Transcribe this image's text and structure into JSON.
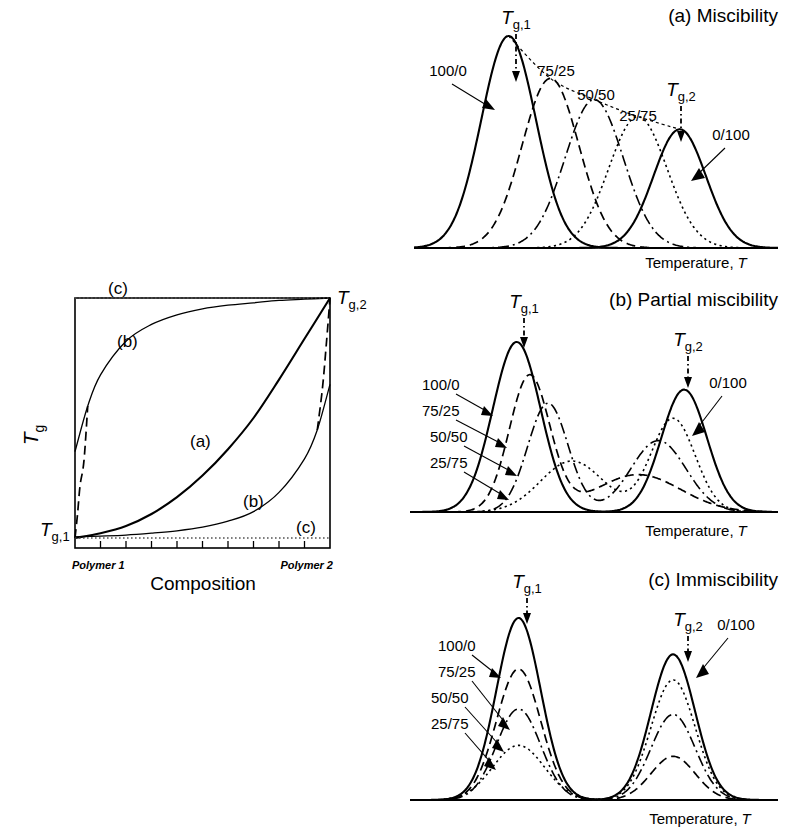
{
  "figure": {
    "axis_label_temperature": "Temperature,",
    "axis_label_temperature_symbol": "T",
    "tg1_symbol": "T",
    "tg1_sub": "g,1",
    "tg2_symbol": "T",
    "tg2_sub": "g,2"
  },
  "left_plot": {
    "ylabel_symbol": "T",
    "ylabel_sub": "g",
    "xlabel": "Composition",
    "x_start_label": "Polymer 1",
    "x_end_label": "Polymer 2",
    "tg1_symbol": "T",
    "tg1_sub": "g,1",
    "tg2_symbol": "T",
    "tg2_sub": "g,2",
    "curve_labels": {
      "a": "(a)",
      "b_upper": "(b)",
      "b_lower": "(b)",
      "c_upper": "(c)",
      "c_lower": "(c)"
    }
  },
  "panels": [
    {
      "id": "a",
      "title": "(a) Miscibility"
    },
    {
      "id": "b",
      "title": "(b) Partial miscibility"
    },
    {
      "id": "c",
      "title": "(c) Immiscibility"
    }
  ],
  "compositions": [
    "100/0",
    "75/25",
    "50/50",
    "25/75",
    "0/100"
  ],
  "chart_data": [
    {
      "type": "line",
      "id": "left-plot",
      "title": "",
      "xlabel": "Composition",
      "ylabel": "Tg",
      "xlim": [
        0,
        1
      ],
      "ylim": [
        0,
        1
      ],
      "xtick_labels": [
        "Polymer 1",
        "Polymer 2"
      ],
      "ytick_labels": [
        "Tg,1",
        "Tg,2"
      ],
      "grid": false,
      "legend": "inline-annotations",
      "series": [
        {
          "name": "(a) miscible - single Tg, convex",
          "style": "solid",
          "x": [
            0,
            0.1,
            0.2,
            0.3,
            0.4,
            0.5,
            0.6,
            0.7,
            0.8,
            0.9,
            1.0
          ],
          "y": [
            0.0,
            0.02,
            0.05,
            0.1,
            0.17,
            0.26,
            0.37,
            0.5,
            0.66,
            0.83,
            1.0
          ]
        },
        {
          "name": "(b) partial - upper branch",
          "style": "solid-thin",
          "x": [
            0,
            0.05,
            0.1,
            0.2,
            0.3,
            0.4,
            0.5,
            0.6,
            0.7,
            0.8,
            0.9,
            1.0
          ],
          "y": [
            0.36,
            0.55,
            0.68,
            0.82,
            0.89,
            0.93,
            0.955,
            0.97,
            0.98,
            0.99,
            0.995,
            1.0
          ]
        },
        {
          "name": "(b) partial - lower branch",
          "style": "solid-thin",
          "x": [
            0,
            0.1,
            0.2,
            0.3,
            0.4,
            0.5,
            0.6,
            0.7,
            0.8,
            0.9,
            0.95,
            1.0
          ],
          "y": [
            0.005,
            0.008,
            0.012,
            0.02,
            0.03,
            0.045,
            0.07,
            0.11,
            0.19,
            0.33,
            0.45,
            0.64
          ]
        },
        {
          "name": "(b) dashed continuation near Polymer 1",
          "style": "dashed",
          "x": [
            0.0,
            0.01,
            0.02,
            0.035,
            0.05
          ],
          "y": [
            0.0,
            0.1,
            0.22,
            0.32,
            0.55
          ]
        },
        {
          "name": "(b) dashed continuation near Polymer 2",
          "style": "dashed",
          "x": [
            0.95,
            0.97,
            0.985,
            1.0
          ],
          "y": [
            0.45,
            0.62,
            0.8,
            1.0
          ]
        },
        {
          "name": "(c) immiscible - Tg,2 constant line",
          "style": "dotted",
          "x": [
            0,
            1
          ],
          "y": [
            1.0,
            1.0
          ]
        },
        {
          "name": "(c) immiscible - Tg,1 constant line",
          "style": "dotted",
          "x": [
            0,
            1
          ],
          "y": [
            0.0,
            0.0
          ]
        }
      ]
    },
    {
      "type": "line",
      "id": "panel-a",
      "title": "(a) Miscibility",
      "xlabel": "Temperature, T",
      "ylabel": "",
      "grid": false,
      "description": "Five DSC-like transition peaks, one per composition, shifting monotonically from Tg,1 to Tg,2 with decreasing amplitude; dashed envelope connects peak maxima.",
      "tg1_x": 0.26,
      "tg2_x": 0.73,
      "peaks": [
        {
          "composition": "100/0",
          "center": 0.26,
          "height": 1.0,
          "width": 0.075,
          "style": "solid"
        },
        {
          "composition": "75/25",
          "center": 0.375,
          "height": 0.8,
          "width": 0.078,
          "style": "dashed"
        },
        {
          "composition": "50/50",
          "center": 0.495,
          "height": 0.7,
          "width": 0.08,
          "style": "dashdot"
        },
        {
          "composition": "25/75",
          "center": 0.615,
          "height": 0.62,
          "width": 0.08,
          "style": "dotted"
        },
        {
          "composition": "0/100",
          "center": 0.73,
          "height": 0.56,
          "width": 0.072,
          "style": "solid"
        }
      ],
      "annotations": [
        "100/0",
        "75/25",
        "50/50",
        "25/75",
        "0/100",
        "Tg,1",
        "Tg,2"
      ]
    },
    {
      "type": "line",
      "id": "panel-b",
      "title": "(b) Partial miscibility",
      "xlabel": "Temperature, T",
      "ylabel": "",
      "grid": false,
      "description": "Two transitions per blend; intermediate compositions show inwardly-shifted, broadened twin peaks between Tg,1 and Tg,2.",
      "tg1_x": 0.29,
      "tg2_x": 0.74,
      "curves": [
        {
          "composition": "100/0",
          "style": "solid",
          "peaks": [
            {
              "center": 0.29,
              "height": 1.0,
              "width": 0.065
            }
          ]
        },
        {
          "composition": "75/25",
          "style": "dashed",
          "peaks": [
            {
              "center": 0.325,
              "height": 0.8,
              "width": 0.055
            },
            {
              "center": 0.62,
              "height": 0.22,
              "width": 0.115
            }
          ]
        },
        {
          "composition": "50/50",
          "style": "dashdot",
          "peaks": [
            {
              "center": 0.375,
              "height": 0.64,
              "width": 0.055
            },
            {
              "center": 0.675,
              "height": 0.42,
              "width": 0.075
            }
          ]
        },
        {
          "composition": "25/75",
          "style": "dotted",
          "peaks": [
            {
              "center": 0.44,
              "height": 0.3,
              "width": 0.085
            },
            {
              "center": 0.715,
              "height": 0.55,
              "width": 0.06
            }
          ]
        },
        {
          "composition": "0/100",
          "style": "solid",
          "peaks": [
            {
              "center": 0.745,
              "height": 0.72,
              "width": 0.062
            }
          ]
        }
      ],
      "annotations": [
        "100/0",
        "75/25",
        "50/50",
        "25/75",
        "0/100",
        "Tg,1",
        "Tg,2"
      ]
    },
    {
      "type": "line",
      "id": "panel-c",
      "title": "(c) Immiscibility",
      "xlabel": "Temperature, T",
      "ylabel": "",
      "grid": false,
      "description": "Two transitions at fixed Tg,1 and Tg,2 for every blend; peak amplitudes scale with the weight fraction of each component.",
      "tg1_x": 0.295,
      "tg2_x": 0.715,
      "curves": [
        {
          "composition": "100/0",
          "style": "solid",
          "peaks": [
            {
              "center": 0.295,
              "height": 1.0,
              "width": 0.06
            }
          ]
        },
        {
          "composition": "75/25",
          "style": "dashed",
          "peaks": [
            {
              "center": 0.295,
              "height": 0.72,
              "width": 0.06
            },
            {
              "center": 0.715,
              "height": 0.24,
              "width": 0.06
            }
          ]
        },
        {
          "composition": "50/50",
          "style": "dashdot",
          "peaks": [
            {
              "center": 0.295,
              "height": 0.5,
              "width": 0.06
            },
            {
              "center": 0.715,
              "height": 0.47,
              "width": 0.06
            }
          ]
        },
        {
          "composition": "25/75",
          "style": "dotted",
          "peaks": [
            {
              "center": 0.295,
              "height": 0.3,
              "width": 0.07
            },
            {
              "center": 0.715,
              "height": 0.66,
              "width": 0.06
            }
          ]
        },
        {
          "composition": "0/100",
          "style": "solid",
          "peaks": [
            {
              "center": 0.715,
              "height": 0.8,
              "width": 0.06
            }
          ]
        }
      ],
      "annotations": [
        "100/0",
        "75/25",
        "50/50",
        "25/75",
        "0/100",
        "Tg,1",
        "Tg,2"
      ]
    }
  ]
}
